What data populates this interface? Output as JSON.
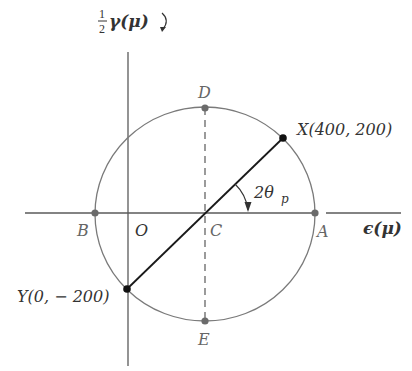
{
  "diagram": {
    "type": "mohr-circle",
    "axes": {
      "vertical_label_fraction_num": "1",
      "vertical_label_fraction_den": "2",
      "vertical_label_symbol": "γ(μ)",
      "horizontal_label": "ϵ(μ)"
    },
    "points": {
      "O": "O",
      "A": "A",
      "B": "B",
      "C": "C",
      "D": "D",
      "E": "E",
      "X": "X(400, 200)",
      "Y": "Y(0, − 200)"
    },
    "angle_label": "2θ",
    "angle_subscript": "p",
    "colors": {
      "circle": "#7a7a7a",
      "diameter": "#1a1a1a",
      "axes": "#5a5a5a",
      "dashed": "#666666",
      "points_gray": "#6b6b6b",
      "points_black": "#111111"
    }
  }
}
